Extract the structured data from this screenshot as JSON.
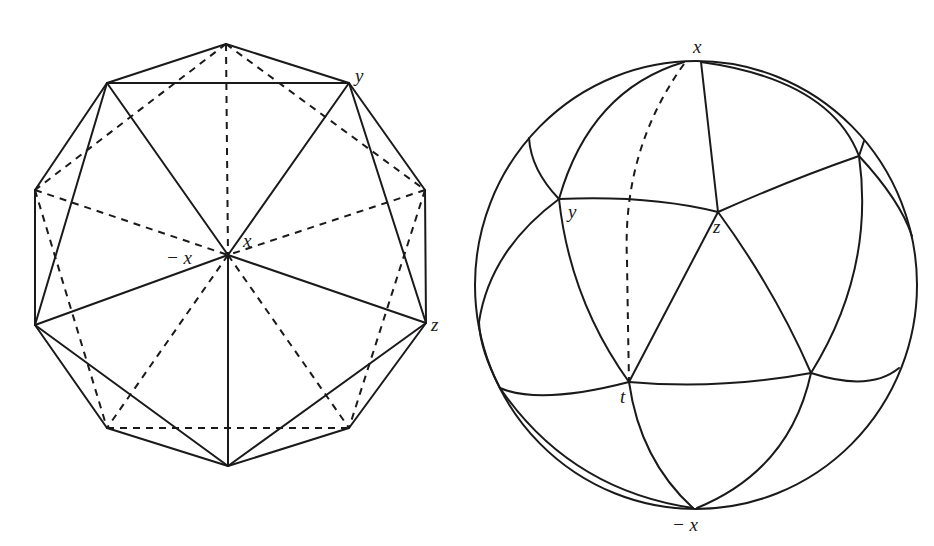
{
  "figure": {
    "left_panel": {
      "title": "Icosahedron projection",
      "labels": {
        "y": "y",
        "x": "x",
        "neg_x": "− x",
        "z": "z"
      }
    },
    "right_panel": {
      "title": "Spherical icosahedron",
      "labels": {
        "x": "x",
        "y": "y",
        "z": "z",
        "t": "t",
        "neg_x": "− x"
      }
    },
    "colors": {
      "line": "#1a1a1a",
      "background": "#ffffff"
    }
  }
}
